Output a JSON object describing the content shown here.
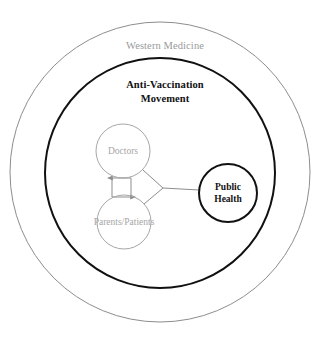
{
  "diagram": {
    "type": "nested-venn-node-diagram",
    "background_color": "#ffffff",
    "rings": [
      {
        "id": "western-medicine",
        "label": "Western Medicine",
        "stroke_color": "#8d8d8d",
        "text_color": "#9a9a9a",
        "stroke_width": 1,
        "center_x": 160,
        "center_y": 172,
        "radius": 150,
        "label_x": 160,
        "label_y": 46
      },
      {
        "id": "anti-vaccination-movement",
        "label_line1": "Anti-Vaccination",
        "label_line2": "Movement",
        "stroke_color": "#111111",
        "text_color": "#111111",
        "stroke_width": 2,
        "center_x": 160,
        "center_y": 173,
        "radius": 115,
        "label_x": 160,
        "label_y": 84
      }
    ],
    "nodes": [
      {
        "id": "doctors",
        "label": "Doctors",
        "stroke_color": "#a6a6a6",
        "text_color": "#a6a6a6",
        "stroke_width": 1,
        "center_x": 123,
        "center_y": 151,
        "radius": 27,
        "emphasis": "muted"
      },
      {
        "id": "parents-patients",
        "label": "Parents/Patients",
        "stroke_color": "#a6a6a6",
        "text_color": "#a6a6a6",
        "stroke_width": 1,
        "center_x": 124,
        "center_y": 222,
        "radius": 27,
        "emphasis": "muted"
      },
      {
        "id": "public-health",
        "label_line1": "Public",
        "label_line2": "Health",
        "stroke_color": "#111111",
        "text_color": "#111111",
        "stroke_width": 2,
        "center_x": 228,
        "center_y": 193,
        "radius": 29,
        "emphasis": "bold"
      }
    ],
    "connectors": [
      {
        "id": "parents-to-doctors-arrow",
        "from": "parents-patients",
        "to": "doctors",
        "direction": "up",
        "arrowhead": true,
        "color": "#8d8d8d"
      },
      {
        "id": "doctors-to-parents-arrow",
        "from": "doctors",
        "to": "parents-patients",
        "direction": "down",
        "arrowhead": true,
        "color": "#8d8d8d"
      },
      {
        "id": "doctors-to-junction",
        "from": "doctors",
        "to": "junction",
        "arrowhead": false,
        "color": "#8d8d8d"
      },
      {
        "id": "parents-to-junction",
        "from": "parents-patients",
        "to": "junction",
        "arrowhead": false,
        "color": "#8d8d8d"
      },
      {
        "id": "junction-to-public-health",
        "from": "junction",
        "to": "public-health",
        "arrowhead": false,
        "color": "#8d8d8d"
      }
    ],
    "junction": {
      "x": 163,
      "y": 188
    }
  },
  "labels": {
    "western_medicine": "Western Medicine",
    "anti_vaccination_line1": "Anti-Vaccination",
    "anti_vaccination_line2": "Movement",
    "doctors": "Doctors",
    "parents_patients": "Parents/Patients",
    "public_health_line1": "Public",
    "public_health_line2": "Health"
  }
}
